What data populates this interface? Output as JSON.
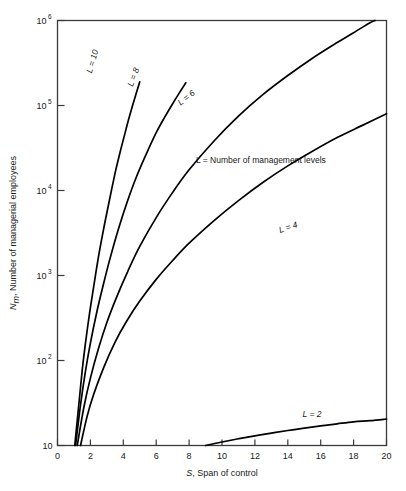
{
  "chart_data": {
    "type": "line",
    "title": "",
    "xlabel": "S, Span of control",
    "ylabel": "N_m, Number of managerial employees",
    "xlabel_italic_part": "S",
    "xlabel_rest": ", Span of control",
    "ylabel_italic_part": "N",
    "ylabel_sub": "m",
    "ylabel_rest": ", Number of managerial employees",
    "annotation": "L = Number of management levels",
    "xlim": [
      0,
      20
    ],
    "ylim": [
      10,
      1000000
    ],
    "yscale": "log",
    "xscale": "linear",
    "grid": false,
    "legend_position": "inline-curve-labels",
    "xticks": [
      0,
      2,
      4,
      6,
      8,
      10,
      12,
      14,
      16,
      18,
      20
    ],
    "xtick_labels": [
      "0",
      "2",
      "4",
      "6",
      "8",
      "10",
      "12",
      "14",
      "16",
      "18",
      "20"
    ],
    "yticks": [
      10,
      100,
      1000,
      10000,
      100000,
      1000000
    ],
    "ytick_labels": [
      "10",
      "10^2",
      "10^3",
      "10^4",
      "10^5",
      "10^6"
    ],
    "ytick_mantissa": [
      "10",
      "10",
      "10",
      "10",
      "10",
      "10"
    ],
    "ytick_exponent": [
      "",
      "2",
      "3",
      "4",
      "5",
      "6"
    ],
    "series": [
      {
        "name": "L = 10",
        "label": "L = 10",
        "L": 10,
        "label_rotation": -74,
        "points": [
          [
            1.05,
            10
          ],
          [
            1.3,
            31
          ],
          [
            1.5,
            76
          ],
          [
            1.7,
            160
          ],
          [
            1.95,
            360
          ],
          [
            2.2,
            740
          ],
          [
            2.5,
            1700
          ],
          [
            2.8,
            3500
          ],
          [
            3.1,
            6800
          ],
          [
            3.5,
            16000
          ],
          [
            3.8,
            28000
          ],
          [
            4.05,
            43000
          ],
          [
            4.3,
            66000
          ],
          [
            4.55,
            98000
          ],
          [
            4.8,
            142000
          ],
          [
            5.0,
            190000
          ]
        ]
      },
      {
        "name": "L = 8",
        "label": "L = 8",
        "L": 8,
        "label_rotation": -70,
        "points": [
          [
            1.1,
            10
          ],
          [
            1.4,
            30
          ],
          [
            1.7,
            75
          ],
          [
            2.0,
            160
          ],
          [
            2.4,
            380
          ],
          [
            2.8,
            800
          ],
          [
            3.2,
            1600
          ],
          [
            3.7,
            3500
          ],
          [
            4.2,
            7000
          ],
          [
            4.8,
            14500
          ],
          [
            5.4,
            27000
          ],
          [
            6.0,
            48000
          ],
          [
            6.5,
            72000
          ],
          [
            7.0,
            105000
          ],
          [
            7.4,
            140000
          ],
          [
            7.8,
            185000
          ]
        ]
      },
      {
        "name": "L = 6",
        "label": "L = 6",
        "L": 6,
        "label_rotation": -38,
        "points": [
          [
            1.2,
            10
          ],
          [
            1.6,
            28
          ],
          [
            2.0,
            62
          ],
          [
            2.5,
            140
          ],
          [
            3.0,
            280
          ],
          [
            3.6,
            560
          ],
          [
            4.3,
            1150
          ],
          [
            5.0,
            2200
          ],
          [
            6.0,
            4800
          ],
          [
            7.0,
            9500
          ],
          [
            8.0,
            17500
          ],
          [
            9.5,
            38000
          ],
          [
            11.0,
            75000
          ],
          [
            12.5,
            135000
          ],
          [
            14.0,
            225000
          ],
          [
            15.5,
            360000
          ],
          [
            17.0,
            550000
          ],
          [
            18.2,
            760000
          ],
          [
            19.0,
            940000
          ],
          [
            19.3,
            1000000
          ]
        ]
      },
      {
        "name": "L = 4",
        "label": "L = 4",
        "L": 4,
        "label_rotation": -18,
        "points": [
          [
            1.4,
            10
          ],
          [
            1.8,
            22
          ],
          [
            2.2,
            40
          ],
          [
            2.8,
            82
          ],
          [
            3.5,
            165
          ],
          [
            4.2,
            290
          ],
          [
            5.0,
            500
          ],
          [
            6.0,
            900
          ],
          [
            7.0,
            1500
          ],
          [
            8.0,
            2400
          ],
          [
            9.5,
            4400
          ],
          [
            11.0,
            7600
          ],
          [
            12.5,
            12500
          ],
          [
            14.0,
            19500
          ],
          [
            15.5,
            29000
          ],
          [
            17.0,
            42000
          ],
          [
            18.5,
            58000
          ],
          [
            20.0,
            80000
          ]
        ]
      },
      {
        "name": "L = 2",
        "label": "L = 2",
        "L": 2,
        "label_rotation": 0,
        "points": [
          [
            9.0,
            10
          ],
          [
            10.0,
            11
          ],
          [
            11.0,
            12
          ],
          [
            12.0,
            13
          ],
          [
            13.0,
            14
          ],
          [
            14.0,
            15
          ],
          [
            15.0,
            16
          ],
          [
            16.0,
            17
          ],
          [
            17.0,
            18
          ],
          [
            18.0,
            19
          ],
          [
            19.0,
            19.6
          ],
          [
            20.0,
            20.5
          ]
        ]
      }
    ]
  },
  "colors": {
    "curve": "#000000",
    "axis": "#3a3a3a",
    "text": "#1a1a1a",
    "background": "#ffffff"
  }
}
